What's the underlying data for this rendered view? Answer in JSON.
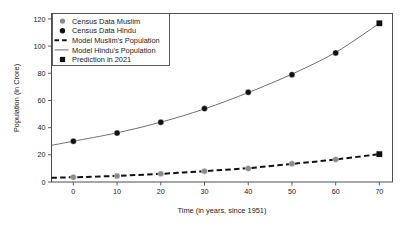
{
  "chart_data": {
    "type": "line",
    "title": "",
    "xlabel": "Time (in years, since 1951)",
    "ylabel": "Population (in Crore)",
    "xlim": [
      -5,
      73
    ],
    "ylim": [
      0,
      124
    ],
    "xticks": [
      0,
      10,
      20,
      30,
      40,
      50,
      60,
      70
    ],
    "xtick_labels": [
      "0",
      "10",
      "20",
      "30",
      "40",
      "50",
      "60",
      "70"
    ],
    "yticks": [
      0,
      20,
      40,
      60,
      80,
      100,
      120
    ],
    "ytick_labels": [
      "0",
      "20",
      "40",
      "60",
      "80",
      "100",
      "120"
    ],
    "grid": false,
    "legend_position": "upper-left",
    "series": [
      {
        "name": "Census Data Muslim",
        "marker": "circle",
        "color": "#8c8c8c",
        "x": [
          0,
          10,
          20,
          30,
          40,
          50,
          60
        ],
        "values": [
          3.5,
          4.5,
          6.0,
          8.0,
          10.0,
          13.5,
          16.5
        ]
      },
      {
        "name": "Census Data Hindu",
        "marker": "circle",
        "color": "#111111",
        "x": [
          0,
          10,
          20,
          30,
          40,
          50,
          60
        ],
        "values": [
          30.0,
          36.0,
          44.0,
          54.0,
          66.0,
          79.0,
          95.0
        ]
      },
      {
        "name": "Model Muslim's Population",
        "marker": "dashed-line",
        "color": "#111111",
        "x": [
          -5,
          0,
          10,
          20,
          30,
          40,
          50,
          60,
          70
        ],
        "values": [
          3.1,
          3.5,
          4.5,
          6.0,
          8.0,
          10.2,
          13.3,
          16.6,
          20.5
        ]
      },
      {
        "name": "Model Hindu's Population",
        "marker": "solid-line",
        "color": "#555555",
        "x": [
          -5,
          0,
          10,
          20,
          30,
          40,
          50,
          60,
          70
        ],
        "values": [
          27.0,
          30.0,
          36.2,
          44.0,
          53.8,
          65.8,
          79.4,
          95.4,
          116.8
        ]
      },
      {
        "name": "Prediction in 2021",
        "marker": "square",
        "color": "#111111",
        "x": [
          70,
          70
        ],
        "values": [
          116.8,
          20.5
        ]
      }
    ]
  },
  "legend": {
    "items": [
      {
        "label": "Census Data Muslim",
        "glyph": "circle-gray-icon"
      },
      {
        "label": "Census Data Hindu",
        "glyph": "circle-black-icon"
      },
      {
        "label": "Model Muslim's Population",
        "glyph": "dashed-line-icon"
      },
      {
        "label": "Model Hindu's Population",
        "glyph": "solid-line-icon"
      },
      {
        "label": "Prediction in 2021",
        "glyph": "square-black-icon"
      }
    ]
  },
  "axes": {
    "x_title": "Time (in years, since 1951)",
    "y_title": "Population (in Crore)"
  },
  "colors": {
    "muslim_marker": "#8c8c8c",
    "hindu_marker": "#111111",
    "model_line": "#555555",
    "frame": "#4d4d4d",
    "text": "#1a1a1a",
    "background": "#ffffff"
  }
}
